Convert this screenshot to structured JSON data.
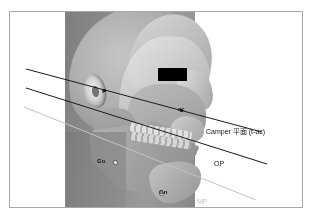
{
  "figure": {
    "border_color": "#a8a8a8",
    "background_color": "#ffffff"
  },
  "planes": [
    {
      "id": "camper",
      "label": "Camper 平面 (t-ac)",
      "color": "#1a1a1a",
      "label_x": 205,
      "label_y": 126
    },
    {
      "id": "occlusal",
      "label": "OP",
      "color": "#1a1a1a",
      "label_x": 213,
      "label_y": 158
    },
    {
      "id": "mandibular",
      "label": "MP",
      "color": "#c0c0c0",
      "label_x": 196,
      "label_y": 196
    }
  ],
  "landmarks": [
    {
      "id": "t",
      "label": "t",
      "x": 101,
      "y": 87,
      "marker": "dark"
    },
    {
      "id": "ac",
      "label": "ac",
      "x": 177,
      "y": 105,
      "marker": "dark"
    },
    {
      "id": "go",
      "label": "Go",
      "x": 96,
      "y": 157,
      "marker": "light"
    },
    {
      "id": "gn",
      "label": "Gn",
      "x": 158,
      "y": 188,
      "marker": "light"
    }
  ],
  "overlay": {
    "eye_bar_color": "#000000"
  }
}
